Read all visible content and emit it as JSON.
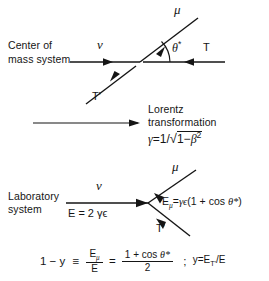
{
  "figure": {
    "background_color": "#ffffff",
    "ink_color": "#151515"
  },
  "cm_frame": {
    "label_line1": "Center of",
    "label_line2": "mass system",
    "incoming_particle": "ν",
    "outgoing_up": "μ",
    "outgoing_down": "T'",
    "incoming_right": "T",
    "angle_label": "θ*"
  },
  "lorentz": {
    "line1": "Lorentz",
    "line2": "transformation",
    "gamma_symbol": "γ",
    "equals": "=",
    "numerator": "1",
    "slash": "/",
    "radical": "√",
    "radicand_one": "1",
    "minus": "−",
    "beta": "β",
    "beta_exponent": "2",
    "formula_plain": "γ = 1/√(1−β²)"
  },
  "lab_frame": {
    "label_line1": "Laboratory",
    "label_line2": "system",
    "incoming_particle": "ν",
    "incoming_energy": "E = 2 γϵ",
    "outgoing_up": "μ",
    "outgoing_down": "T'",
    "muon_energy": "Eμ = γϵ(1 + cos θ*)",
    "muon_energy_parts": {
      "symbol": "E",
      "subscript": "μ",
      "equals": "=",
      "gamma_epsilon": "γϵ",
      "paren_open": "(",
      "one_plus_cos": "1 + cos ",
      "theta_star": "θ*",
      "paren_close": ")"
    }
  },
  "bottom_equation": {
    "lhs": "1 − y",
    "identity": "≡",
    "frac1_num": "Eμ",
    "frac1_num_symbol": "E",
    "frac1_num_sub": "μ",
    "frac1_den": "E",
    "equals": "=",
    "frac2_num": "1 + cos θ*",
    "frac2_num_prefix": "1 + cos ",
    "frac2_num_theta": "θ*",
    "frac2_den": "2",
    "separator": ";",
    "rhs": "y = ET' / E",
    "rhs_y": "y",
    "rhs_equals": "=",
    "rhs_E": "E",
    "rhs_sub": "T'",
    "rhs_slash": "/",
    "rhs_den": "E"
  }
}
